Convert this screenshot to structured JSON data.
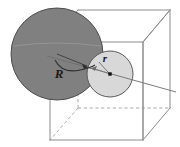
{
  "figure": {
    "name": "two-tangent-spheres-in-cube",
    "background_color": "#ffffff",
    "width": 180,
    "height": 147,
    "labels": {
      "large_radius": "R",
      "small_radius": "r"
    },
    "colors": {
      "large_sphere_fill": "#808080",
      "large_sphere_stroke": "#4d4d4d",
      "small_sphere_fill": "#d8d8d8",
      "small_sphere_stroke": "#595959",
      "cube_edge_visible": "#8c8c8c",
      "cube_edge_hidden": "#a8a8a8",
      "label_color": "#1a1a1a",
      "leader_line": "#6e6e6e",
      "center_dot": "#111111"
    },
    "large_sphere": {
      "name": "large-sphere",
      "center_x": 57,
      "center_y": 54,
      "radius": 46,
      "label": "R",
      "label_x": 59,
      "label_y": 78
    },
    "small_sphere": {
      "name": "small-sphere",
      "center_x": 110,
      "center_y": 74,
      "radius": 23,
      "label": "r",
      "label_x": 105,
      "label_y": 62
    },
    "cube": {
      "name": "wireframe-cube",
      "front_face": {
        "left": 50,
        "top": 42,
        "right": 143,
        "bottom": 140
      },
      "back_face": {
        "left": 78,
        "top": 10,
        "right": 170,
        "bottom": 108
      },
      "hidden_corner": {
        "x": 78,
        "y": 108
      }
    },
    "center_line": {
      "name": "sphere-center-axis",
      "x1": 47,
      "y1": 56,
      "x2": 176,
      "y2": 92
    }
  }
}
